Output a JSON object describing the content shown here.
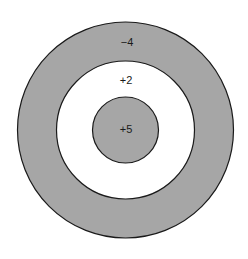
{
  "diagram": {
    "type": "concentric-target",
    "colors": {
      "background": "#ffffff",
      "shaded": "#a6a6a6",
      "unshaded": "#ffffff",
      "stroke": "#1a1a1a"
    },
    "rings": [
      {
        "name": "outer",
        "label": "−4",
        "fill": "shaded"
      },
      {
        "name": "middle",
        "label": "+2",
        "fill": "unshaded"
      },
      {
        "name": "inner",
        "label": "+5",
        "fill": "shaded"
      }
    ]
  }
}
